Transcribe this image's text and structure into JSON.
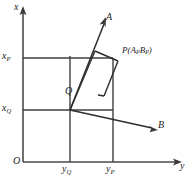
{
  "figure": {
    "background_color": "#ffffff",
    "line_color": "#2e2e2e",
    "axis_color": "#4a4a4a",
    "axes": {
      "vertical": {
        "name": "x-axis",
        "label": "x",
        "arrow": "up"
      },
      "horizontal": {
        "name": "y-axis",
        "label": "y",
        "arrow": "right"
      },
      "origin_label": "O"
    },
    "tick_labels": {
      "x_upper": {
        "base": "x",
        "sub": "P"
      },
      "x_lower": {
        "base": "x",
        "sub": "Q"
      },
      "y_left": {
        "base": "y",
        "sub": "Q"
      },
      "y_right": {
        "base": "y",
        "sub": "P"
      }
    },
    "rays": [
      {
        "name": "ray-a",
        "label": "A",
        "direction": "up-right"
      },
      {
        "name": "ray-b",
        "label": "B",
        "direction": "down-right"
      }
    ],
    "points": [
      {
        "name": "point-q",
        "label": "Q"
      },
      {
        "name": "point-p",
        "label_base": "P",
        "label_open": "(",
        "label_a": "A",
        "label_a_sub": "P",
        "label_b": "B",
        "label_b_sub": "P",
        "label_close": ")"
      }
    ]
  },
  "geometry": {
    "canvas": {
      "width": 189,
      "height": 182
    },
    "axis_origin": {
      "x": 23,
      "y": 162
    },
    "axis_x_top": {
      "x": 23,
      "y": 9
    },
    "axis_y_right": {
      "x": 181,
      "y": 162
    },
    "x_p_level_y": 58,
    "x_q_level_y": 110,
    "y_q_level_x": 70,
    "y_p_level_x": 113,
    "point_p": {
      "x": 113,
      "y": 58
    },
    "point_q": {
      "x": 70,
      "y": 110
    },
    "ray_a_tip": {
      "x": 103,
      "y": 20
    },
    "ray_b_tip": {
      "x": 156,
      "y": 129
    },
    "quad": [
      {
        "x": 70,
        "y": 110
      },
      {
        "x": 95,
        "y": 51
      },
      {
        "x": 118,
        "y": 61
      },
      {
        "x": 104,
        "y": 96
      }
    ]
  }
}
